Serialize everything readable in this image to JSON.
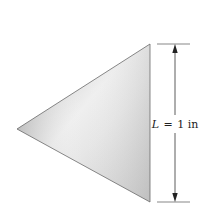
{
  "diagram": {
    "shape": "equilateral-triangle",
    "fill_gradient": {
      "dark": "#b8b8b8",
      "light": "#f2f2f2",
      "mid": "#d0d0d0"
    },
    "stroke_color": "#6a6a6a",
    "vertices": {
      "top": [
        150,
        44
      ],
      "bottom": [
        150,
        202
      ],
      "left": [
        17,
        129
      ]
    },
    "dimension": {
      "symbol": "L",
      "equals": "=",
      "value": "1 in",
      "label": "L = 1 in",
      "line_color": "#333333"
    }
  }
}
